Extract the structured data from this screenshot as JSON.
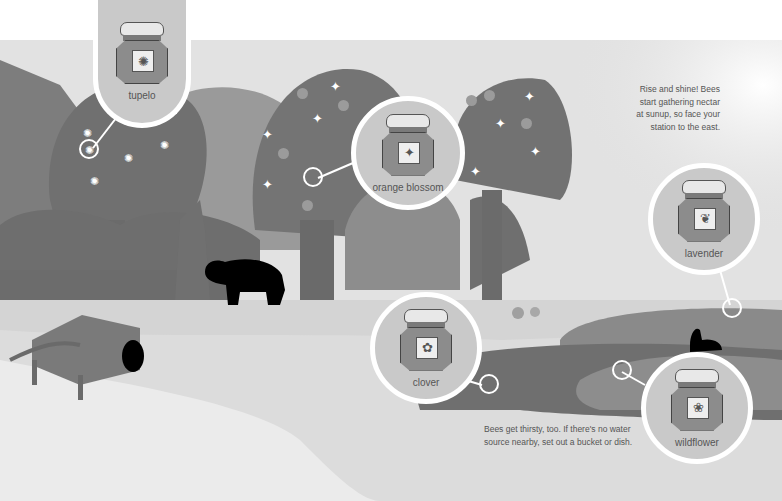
{
  "scene": {
    "title": "Honey varieties illustration",
    "palette": {
      "sky": "#e4e4e4",
      "tree_dark": "#6f6f6f",
      "tree_mid": "#8a8a8a",
      "tree_light": "#9e9e9e",
      "ground": "#d0d0d0",
      "path": "#e9e9e9",
      "field": "#767676",
      "callout_bg": "#c9c9c9",
      "silhouette": "#000000"
    }
  },
  "callouts": [
    {
      "id": "tupelo",
      "label": "tupelo",
      "icon": "tupelo-flower-icon",
      "glyph": "✺"
    },
    {
      "id": "orange-blossom",
      "label": "orange blossom",
      "icon": "orange-blossom-icon",
      "glyph": "✦"
    },
    {
      "id": "lavender",
      "label": "lavender",
      "icon": "lavender-sprig-icon",
      "glyph": "❦"
    },
    {
      "id": "clover",
      "label": "clover",
      "icon": "clover-icon",
      "glyph": "✿"
    },
    {
      "id": "wildflower",
      "label": "wildflower",
      "icon": "wildflower-icon",
      "glyph": "❀"
    }
  ],
  "notes": {
    "sunrise": [
      "Rise and shine! Bees",
      "start gathering nectar",
      "at sunup, so face your",
      "station to the east."
    ],
    "water": [
      "Bees get thirsty, too. If there's no water",
      "source nearby, set out a bucket or dish."
    ]
  },
  "decor": {
    "tupelo_flower": "✺",
    "orange_flower": "✦"
  }
}
